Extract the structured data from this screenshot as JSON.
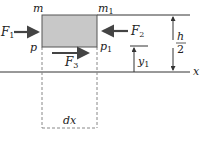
{
  "diagram": {
    "labels": {
      "m": "m",
      "m1": "m",
      "m1_sub": "1",
      "p": "p",
      "p1": "p",
      "p1_sub": "1",
      "F1": "F",
      "F1_sub": "1",
      "F2": "F",
      "F2_sub": "2",
      "F3": "F",
      "F3_sub": "3",
      "y1": "y",
      "y1_sub": "1",
      "h": "h",
      "two": "2",
      "x": "x",
      "dx": "dx"
    },
    "colors": {
      "box_fill": "#c8c8c8",
      "line": "#333333",
      "arrow": "#444444",
      "dashed": "#888888"
    }
  }
}
